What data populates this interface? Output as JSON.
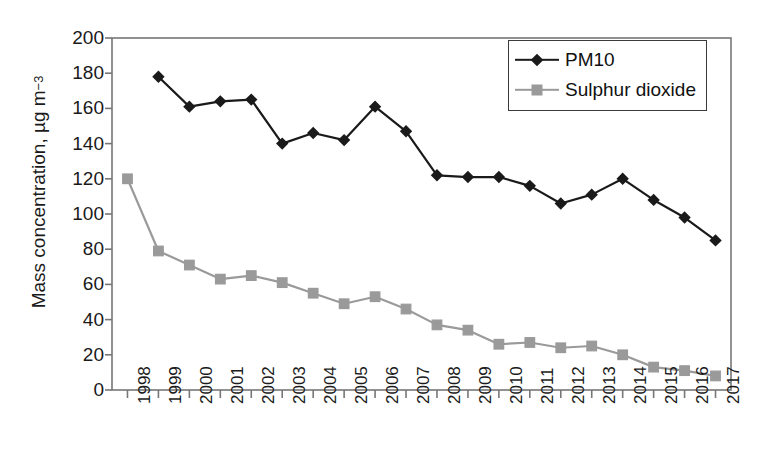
{
  "chart_data": {
    "type": "line",
    "title": "",
    "xlabel": "",
    "ylabel": "Mass concentration, µg m",
    "ylabel_exponent": "−3",
    "ylim": [
      0,
      200
    ],
    "yticks": [
      0,
      20,
      40,
      60,
      80,
      100,
      120,
      140,
      160,
      180,
      200
    ],
    "ytick_labels": [
      "0",
      "20",
      "40",
      "60",
      "80",
      "100",
      "120",
      "140",
      "160",
      "180",
      "200"
    ],
    "grid": false,
    "legend_position": "top-right",
    "categories": [
      "1998",
      "1999",
      "2000",
      "2001",
      "2002",
      "2003",
      "2004",
      "2005",
      "2006",
      "2007",
      "2008",
      "2009",
      "2010",
      "2011",
      "2012",
      "2013",
      "2014",
      "2015",
      "2016",
      "2017"
    ],
    "series": [
      {
        "name": "PM10",
        "color": "#1a1a1a",
        "marker": "diamond",
        "values": [
          null,
          178,
          161,
          164,
          165,
          140,
          146,
          142,
          161,
          147,
          122,
          121,
          121,
          116,
          106,
          111,
          120,
          108,
          98,
          85
        ]
      },
      {
        "name": "Sulphur dioxide",
        "color": "#9a9a9a",
        "marker": "square",
        "values": [
          120,
          79,
          71,
          63,
          65,
          61,
          55,
          49,
          53,
          46,
          37,
          34,
          26,
          27,
          24,
          25,
          20,
          13,
          11,
          8
        ]
      }
    ]
  },
  "legend": {
    "entries": [
      {
        "label": "PM10"
      },
      {
        "label": "Sulphur dioxide"
      }
    ]
  },
  "axis_colors": {
    "frame": "#777777",
    "text": "#1a1a1a",
    "pm10": "#1a1a1a",
    "so2": "#9a9a9a"
  }
}
